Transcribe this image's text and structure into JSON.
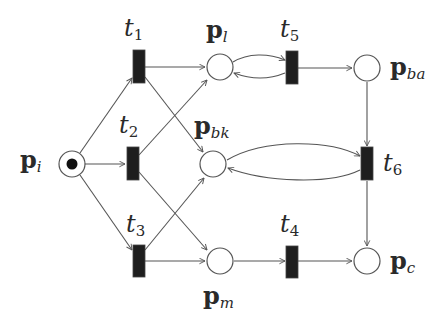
{
  "diagram": {
    "type": "petri-net",
    "colors": {
      "stroke": "#555555",
      "transition_fill": "#1e1e1e",
      "token": "#111111",
      "text": "#2a2a2a",
      "background": "#ffffff"
    },
    "places": [
      {
        "id": "p_i",
        "base": "p",
        "sub": "i",
        "tokens": 1
      },
      {
        "id": "p_l",
        "base": "p",
        "sub": "l",
        "tokens": 0
      },
      {
        "id": "p_bk",
        "base": "p",
        "sub": "bk",
        "tokens": 0
      },
      {
        "id": "p_m",
        "base": "p",
        "sub": "m",
        "tokens": 0
      },
      {
        "id": "p_ba",
        "base": "p",
        "sub": "ba",
        "tokens": 0
      },
      {
        "id": "p_c",
        "base": "p",
        "sub": "c",
        "tokens": 0
      }
    ],
    "transitions": [
      {
        "id": "t1",
        "base": "t",
        "sub": "1"
      },
      {
        "id": "t2",
        "base": "t",
        "sub": "2"
      },
      {
        "id": "t3",
        "base": "t",
        "sub": "3"
      },
      {
        "id": "t4",
        "base": "t",
        "sub": "4"
      },
      {
        "id": "t5",
        "base": "t",
        "sub": "5"
      },
      {
        "id": "t6",
        "base": "t",
        "sub": "6"
      }
    ],
    "arcs": [
      {
        "from": "p_i",
        "to": "t1"
      },
      {
        "from": "p_i",
        "to": "t2"
      },
      {
        "from": "p_i",
        "to": "t3"
      },
      {
        "from": "t1",
        "to": "p_l"
      },
      {
        "from": "t1",
        "to": "p_m"
      },
      {
        "from": "t2",
        "to": "p_l"
      },
      {
        "from": "t2",
        "to": "p_m"
      },
      {
        "from": "t3",
        "to": "p_bk"
      },
      {
        "from": "t3",
        "to": "p_m"
      },
      {
        "from": "p_l",
        "to": "t5"
      },
      {
        "from": "t5",
        "to": "p_l"
      },
      {
        "from": "t5",
        "to": "p_ba"
      },
      {
        "from": "p_ba",
        "to": "t6"
      },
      {
        "from": "p_bk",
        "to": "t6"
      },
      {
        "from": "t6",
        "to": "p_bk"
      },
      {
        "from": "t6",
        "to": "p_c"
      },
      {
        "from": "p_m",
        "to": "t4"
      },
      {
        "from": "t4",
        "to": "p_c"
      }
    ]
  }
}
